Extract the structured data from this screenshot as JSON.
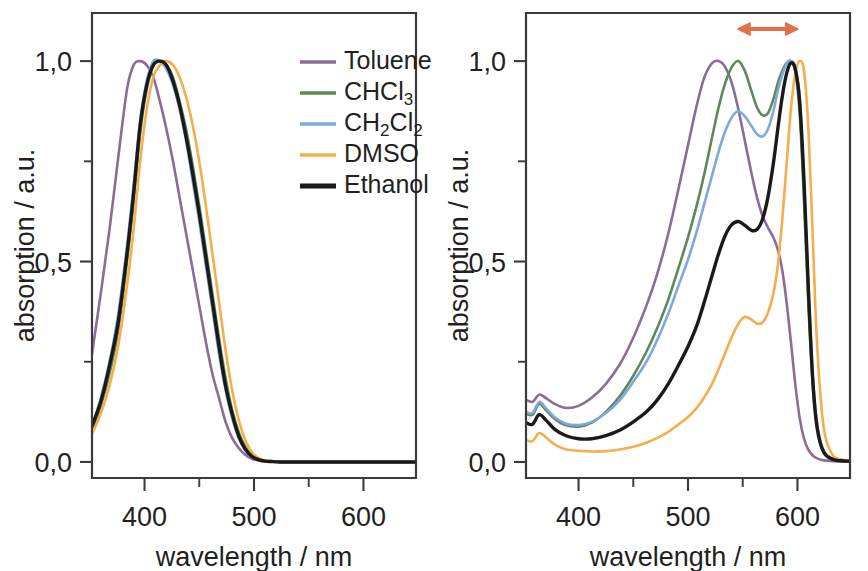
{
  "figure": {
    "panels": [
      "absorption-spectra-panel-a",
      "absorption-spectra-panel-b"
    ]
  },
  "axes": {
    "xlabel": "wavelength / nm",
    "ylabel": "absorption / a.u.",
    "x_ticklabels": [
      "400",
      "500",
      "600"
    ],
    "y_ticklabels": [
      "0,0",
      "0,5",
      "1,0"
    ],
    "x_tickvalues": [
      400,
      500,
      600
    ],
    "y_tickvalues": [
      0.0,
      0.5,
      1.0
    ],
    "xlim": [
      352,
      648
    ],
    "ylim": [
      -0.04,
      1.12
    ],
    "decimal_separator": ","
  },
  "colors": {
    "toluene": "#8a6d96",
    "chcl3": "#5c8a58",
    "ch2cl2": "#7fa8dd",
    "dmso": "#f4ae4c",
    "ethanol": "#1a1a1a",
    "arrow": "#e2704a",
    "axis": "#3b3a3c",
    "text": "#231f20"
  },
  "legend": {
    "position": "top-right-panel-a",
    "entries": [
      {
        "key": "toluene",
        "label": "Toluene",
        "sub": "",
        "label2": "",
        "sub2": "",
        "color": "#8a6d96",
        "thick": false
      },
      {
        "key": "chcl3",
        "label": "CHCl",
        "sub": "3",
        "label2": "",
        "sub2": "",
        "color": "#5c8a58",
        "thick": false
      },
      {
        "key": "ch2cl2",
        "label": "CH",
        "sub": "2",
        "label2": "Cl",
        "sub2": "2",
        "color": "#7fa8dd",
        "thick": false
      },
      {
        "key": "dmso",
        "label": "DMSO",
        "sub": "",
        "label2": "",
        "sub2": "",
        "color": "#f4ae4c",
        "thick": false
      },
      {
        "key": "ethanol",
        "label": "Ethanol",
        "sub": "",
        "label2": "",
        "sub2": "",
        "color": "#1a1a1a",
        "thick": true
      }
    ]
  },
  "annotations": {
    "arrow": {
      "name": "bathochromic-shift-arrow",
      "type": "double-headed-arrow",
      "panel": "b",
      "x_start_nm": 545,
      "x_end_nm": 601,
      "y_value": 1.08,
      "color": "#e2704a"
    }
  },
  "chart_data": [
    {
      "id": "panel-a",
      "type": "line",
      "title": "",
      "xlabel": "wavelength / nm",
      "ylabel": "absorption / a.u.",
      "xlim": [
        352,
        648
      ],
      "ylim": [
        -0.04,
        1.12
      ],
      "xticks": [
        400,
        500,
        600
      ],
      "yticks": [
        0.0,
        0.5,
        1.0
      ],
      "grid": false,
      "legend": "top-right",
      "x": [
        352,
        360,
        368,
        376,
        384,
        390,
        396,
        402,
        408,
        414,
        420,
        426,
        432,
        438,
        444,
        450,
        456,
        462,
        468,
        474,
        480,
        486,
        492,
        498,
        504,
        510,
        516,
        524,
        532,
        545,
        560,
        580,
        600,
        620,
        648
      ],
      "series": [
        {
          "name": "Toluene",
          "color": "#8a6d96",
          "values": [
            0.27,
            0.42,
            0.58,
            0.76,
            0.93,
            0.99,
            1.0,
            0.99,
            0.96,
            0.9,
            0.83,
            0.75,
            0.66,
            0.57,
            0.48,
            0.39,
            0.3,
            0.22,
            0.16,
            0.1,
            0.06,
            0.035,
            0.018,
            0.008,
            0.004,
            0.002,
            0.001,
            0.0,
            0.0,
            0.0,
            0.0,
            0.0,
            0.0,
            0.0,
            0.0
          ]
        },
        {
          "name": "CHCl3",
          "color": "#5c8a58",
          "values": [
            0.08,
            0.14,
            0.22,
            0.33,
            0.5,
            0.65,
            0.82,
            0.93,
            0.99,
            1.0,
            0.99,
            0.96,
            0.9,
            0.83,
            0.74,
            0.64,
            0.53,
            0.42,
            0.31,
            0.21,
            0.13,
            0.075,
            0.038,
            0.017,
            0.007,
            0.003,
            0.001,
            0.0,
            0.0,
            0.0,
            0.0,
            0.0,
            0.0,
            0.0,
            0.0
          ]
        },
        {
          "name": "CH2Cl2",
          "color": "#7fa8dd",
          "values": [
            0.09,
            0.16,
            0.25,
            0.37,
            0.54,
            0.69,
            0.85,
            0.95,
            1.0,
            1.0,
            0.98,
            0.94,
            0.88,
            0.8,
            0.7,
            0.6,
            0.49,
            0.38,
            0.27,
            0.18,
            0.11,
            0.06,
            0.03,
            0.013,
            0.005,
            0.002,
            0.001,
            0.0,
            0.0,
            0.0,
            0.0,
            0.0,
            0.0,
            0.0,
            0.0
          ]
        },
        {
          "name": "DMSO",
          "color": "#f4ae4c",
          "values": [
            0.07,
            0.12,
            0.19,
            0.29,
            0.44,
            0.58,
            0.75,
            0.88,
            0.96,
            0.99,
            1.0,
            0.99,
            0.96,
            0.91,
            0.84,
            0.75,
            0.64,
            0.52,
            0.4,
            0.28,
            0.18,
            0.105,
            0.055,
            0.025,
            0.01,
            0.004,
            0.002,
            0.0,
            0.0,
            0.0,
            0.0,
            0.0,
            0.0,
            0.0,
            0.0
          ]
        },
        {
          "name": "Ethanol",
          "color": "#1a1a1a",
          "values": [
            0.09,
            0.15,
            0.24,
            0.35,
            0.52,
            0.67,
            0.84,
            0.94,
            0.99,
            1.0,
            0.99,
            0.95,
            0.89,
            0.81,
            0.72,
            0.62,
            0.51,
            0.4,
            0.29,
            0.19,
            0.12,
            0.065,
            0.032,
            0.014,
            0.006,
            0.002,
            0.001,
            0.0,
            0.0,
            0.0,
            0.0,
            0.0,
            0.0,
            0.0,
            0.0
          ]
        }
      ]
    },
    {
      "id": "panel-b",
      "type": "line",
      "title": "",
      "xlabel": "wavelength / nm",
      "ylabel": "absorption / a.u.",
      "xlim": [
        352,
        648
      ],
      "ylim": [
        -0.04,
        1.12
      ],
      "xticks": [
        400,
        500,
        600
      ],
      "yticks": [
        0.0,
        0.5,
        1.0
      ],
      "grid": false,
      "legend": "none",
      "x": [
        352,
        358,
        364,
        370,
        378,
        388,
        400,
        412,
        425,
        438,
        450,
        462,
        472,
        482,
        492,
        500,
        508,
        515,
        522,
        528,
        534,
        540,
        546,
        552,
        558,
        563,
        568,
        573,
        578,
        582,
        586,
        590,
        594,
        598,
        602,
        606,
        610,
        614,
        618,
        624,
        632,
        640,
        648
      ],
      "series": [
        {
          "name": "Toluene",
          "color": "#8a6d96",
          "values": [
            0.155,
            0.15,
            0.168,
            0.16,
            0.145,
            0.135,
            0.14,
            0.16,
            0.195,
            0.245,
            0.31,
            0.39,
            0.47,
            0.57,
            0.69,
            0.79,
            0.89,
            0.96,
            0.995,
            1.0,
            0.985,
            0.945,
            0.88,
            0.8,
            0.72,
            0.66,
            0.615,
            0.585,
            0.56,
            0.53,
            0.48,
            0.4,
            0.3,
            0.195,
            0.11,
            0.058,
            0.03,
            0.016,
            0.009,
            0.004,
            0.002,
            0.001,
            0.001
          ]
        },
        {
          "name": "CHCl3",
          "color": "#5c8a58",
          "values": [
            0.12,
            0.118,
            0.145,
            0.13,
            0.108,
            0.092,
            0.088,
            0.098,
            0.125,
            0.165,
            0.215,
            0.275,
            0.335,
            0.405,
            0.49,
            0.56,
            0.64,
            0.72,
            0.81,
            0.885,
            0.945,
            0.985,
            1.0,
            0.975,
            0.925,
            0.885,
            0.865,
            0.87,
            0.905,
            0.945,
            0.975,
            0.995,
            1.0,
            0.975,
            0.87,
            0.65,
            0.39,
            0.19,
            0.085,
            0.026,
            0.008,
            0.003,
            0.002
          ]
        },
        {
          "name": "CH2Cl2",
          "color": "#7fa8dd",
          "values": [
            0.125,
            0.122,
            0.15,
            0.135,
            0.112,
            0.096,
            0.092,
            0.1,
            0.122,
            0.155,
            0.2,
            0.25,
            0.305,
            0.37,
            0.445,
            0.505,
            0.575,
            0.645,
            0.715,
            0.775,
            0.825,
            0.86,
            0.875,
            0.862,
            0.838,
            0.818,
            0.812,
            0.83,
            0.875,
            0.925,
            0.965,
            0.992,
            1.0,
            0.985,
            0.905,
            0.7,
            0.43,
            0.215,
            0.095,
            0.028,
            0.008,
            0.003,
            0.002
          ]
        },
        {
          "name": "DMSO",
          "color": "#f4ae4c",
          "values": [
            0.055,
            0.052,
            0.072,
            0.062,
            0.044,
            0.032,
            0.028,
            0.026,
            0.027,
            0.031,
            0.038,
            0.048,
            0.06,
            0.075,
            0.095,
            0.112,
            0.135,
            0.162,
            0.195,
            0.232,
            0.272,
            0.312,
            0.345,
            0.362,
            0.355,
            0.345,
            0.348,
            0.372,
            0.42,
            0.49,
            0.6,
            0.74,
            0.88,
            0.97,
            1.0,
            0.975,
            0.83,
            0.56,
            0.29,
            0.085,
            0.018,
            0.006,
            0.003
          ]
        },
        {
          "name": "Ethanol",
          "color": "#1a1a1a",
          "values": [
            0.098,
            0.094,
            0.118,
            0.105,
            0.082,
            0.066,
            0.058,
            0.058,
            0.066,
            0.08,
            0.1,
            0.125,
            0.155,
            0.195,
            0.245,
            0.288,
            0.34,
            0.4,
            0.465,
            0.52,
            0.565,
            0.592,
            0.6,
            0.59,
            0.578,
            0.58,
            0.605,
            0.66,
            0.745,
            0.83,
            0.91,
            0.968,
            0.995,
            0.98,
            0.9,
            0.7,
            0.43,
            0.205,
            0.085,
            0.024,
            0.007,
            0.003,
            0.002
          ]
        }
      ]
    }
  ]
}
